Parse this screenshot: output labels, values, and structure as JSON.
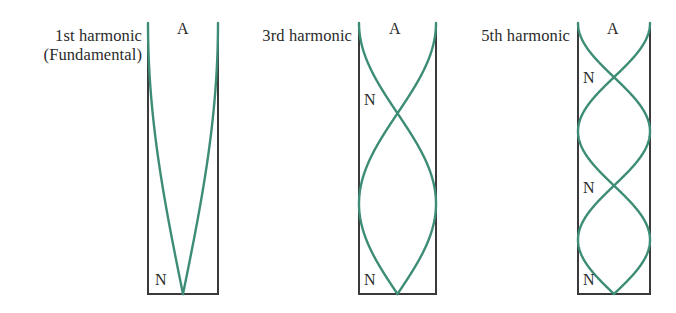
{
  "figure": {
    "background_color": "#ffffff",
    "wave_color": "#3d8c76",
    "tube_color": "#3a3a3a",
    "text_color": "#2b2b2b",
    "antinode_symbol": "A",
    "node_symbol": "N"
  },
  "panels": [
    {
      "id": "first-harmonic",
      "label_line1": "1st harmonic",
      "label_line2": "(Fundamental)",
      "label_x": 18,
      "label_y": 26,
      "label_width": 124,
      "tube": {
        "left": 148,
        "right": 218,
        "top": 23,
        "bottom": 294
      },
      "antinode_label": {
        "text": "A",
        "x": 177,
        "y": 21
      },
      "node_labels": [
        {
          "text": "N",
          "x": 155,
          "y": 272
        }
      ],
      "wave": {
        "half_wavelengths": 0.5,
        "nodes_y": [
          294
        ],
        "antinodes_y": [
          23
        ]
      }
    },
    {
      "id": "third-harmonic",
      "label_line1": "3rd harmonic",
      "label_line2": "",
      "label_x": 234,
      "label_y": 26,
      "label_width": 118,
      "tube": {
        "left": 359,
        "right": 436,
        "top": 23,
        "bottom": 294
      },
      "antinode_label": {
        "text": "A",
        "x": 389,
        "y": 21
      },
      "node_labels": [
        {
          "text": "N",
          "x": 364,
          "y": 92
        },
        {
          "text": "N",
          "x": 364,
          "y": 272
        }
      ],
      "wave": {
        "half_wavelengths": 1.5,
        "nodes_y": [
          100,
          294
        ],
        "antinodes_y": [
          23,
          197
        ]
      }
    },
    {
      "id": "fifth-harmonic",
      "label_line1": "5th harmonic",
      "label_line2": "",
      "label_x": 452,
      "label_y": 26,
      "label_width": 118,
      "tube": {
        "left": 578,
        "right": 650,
        "top": 23,
        "bottom": 294
      },
      "antinode_label": {
        "text": "A",
        "x": 607,
        "y": 21
      },
      "node_labels": [
        {
          "text": "N",
          "x": 583,
          "y": 70
        },
        {
          "text": "N",
          "x": 583,
          "y": 180
        },
        {
          "text": "N",
          "x": 583,
          "y": 272
        }
      ],
      "wave": {
        "half_wavelengths": 2.5,
        "nodes_y": [
          77,
          186,
          294
        ],
        "antinodes_y": [
          23,
          131,
          240
        ]
      }
    }
  ]
}
